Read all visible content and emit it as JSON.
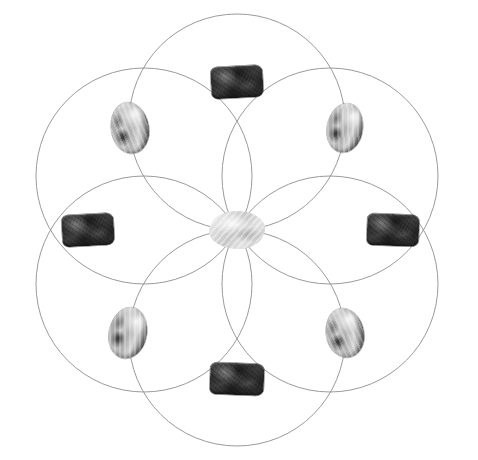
{
  "figure": {
    "title": "Seed of Life Crystal Grid",
    "background_color": "#ffffff",
    "width": 478,
    "height": 460
  },
  "geometry": {
    "pattern_name": "Seed of Life",
    "center_x": 237,
    "center_y": 230,
    "circle_radius": 108,
    "circle_count": 6,
    "line_color": "#8f8f8f",
    "line_width": 0.9,
    "bounds": {
      "left": 20,
      "top": 22,
      "right": 455,
      "bottom": 437
    },
    "circles": [
      {
        "name": "circle-top",
        "cx": 237,
        "cy": 122,
        "r": 108,
        "angle_deg": 270
      },
      {
        "name": "circle-upper-right",
        "cx": 330,
        "cy": 176,
        "r": 108,
        "angle_deg": 330
      },
      {
        "name": "circle-lower-right",
        "cx": 330,
        "cy": 284,
        "r": 108,
        "angle_deg": 30
      },
      {
        "name": "circle-bottom",
        "cx": 237,
        "cy": 338,
        "r": 108,
        "angle_deg": 90
      },
      {
        "name": "circle-lower-left",
        "cx": 144,
        "cy": 284,
        "r": 108,
        "angle_deg": 150
      },
      {
        "name": "circle-upper-left",
        "cx": 144,
        "cy": 176,
        "r": 108,
        "angle_deg": 210
      }
    ]
  },
  "stones": [
    {
      "name": "stone-center",
      "type": "center",
      "shape": "rounded-irregular",
      "tone": "pale-white",
      "x": 237,
      "y": 230,
      "w": 56,
      "h": 38,
      "rotation": 0,
      "label": "centre crystal"
    },
    {
      "name": "stone-top",
      "type": "rectangle",
      "shape": "rectangle",
      "tone": "dark",
      "x": 237,
      "y": 82,
      "w": 52,
      "h": 32,
      "rotation": -3,
      "label": "top stone"
    },
    {
      "name": "stone-upper-right",
      "type": "oval",
      "shape": "oval",
      "tone": "pale-banded",
      "x": 345,
      "y": 128,
      "w": 36,
      "h": 50,
      "rotation": 10,
      "label": "upper-right stone"
    },
    {
      "name": "stone-right",
      "type": "rectangle",
      "shape": "rectangle",
      "tone": "dark",
      "x": 393,
      "y": 230,
      "w": 52,
      "h": 32,
      "rotation": 2,
      "label": "right stone"
    },
    {
      "name": "stone-lower-right",
      "type": "oval",
      "shape": "oval",
      "tone": "pale-banded",
      "x": 345,
      "y": 333,
      "w": 38,
      "h": 50,
      "rotation": -12,
      "label": "lower-right stone"
    },
    {
      "name": "stone-bottom",
      "type": "rectangle",
      "shape": "rectangle",
      "tone": "dark",
      "x": 237,
      "y": 379,
      "w": 54,
      "h": 32,
      "rotation": 2,
      "label": "bottom stone"
    },
    {
      "name": "stone-lower-left",
      "type": "oval",
      "shape": "oval",
      "tone": "pale-banded",
      "x": 128,
      "y": 333,
      "w": 38,
      "h": 52,
      "rotation": 12,
      "label": "lower-left stone"
    },
    {
      "name": "stone-left",
      "type": "rectangle",
      "shape": "rectangle",
      "tone": "dark",
      "x": 88,
      "y": 230,
      "w": 52,
      "h": 32,
      "rotation": -3,
      "label": "left stone"
    },
    {
      "name": "stone-upper-left",
      "type": "oval",
      "shape": "oval",
      "tone": "pale-banded",
      "x": 130,
      "y": 128,
      "w": 38,
      "h": 52,
      "rotation": -10,
      "label": "upper-left stone"
    }
  ]
}
